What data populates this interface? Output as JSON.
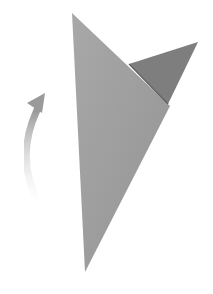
{
  "diagram": {
    "type": "origami-step",
    "background": "#ffffff",
    "shapes": {
      "main_triangle": {
        "color": "#a0a0a0",
        "points": "72,13 170,106 85,272"
      },
      "folded_flap": {
        "color": "#7e7e7e",
        "points": "129,64 198,42 168,104"
      }
    },
    "arrow": {
      "direction": "rotate-upward",
      "color": "#9a9a9a",
      "path": "M 40 205 Q 14 160 37 110",
      "head": "45,93 27,103 42,113"
    }
  }
}
